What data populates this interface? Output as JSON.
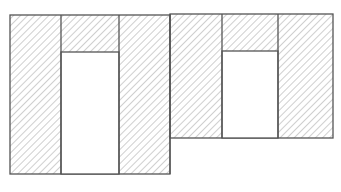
{
  "diagram": {
    "colors": {
      "stroke": "#555555",
      "hatch": "#9a9a9a",
      "fill": "#ffffff"
    },
    "blocks": [
      {
        "name": "left-block",
        "outer": {
          "x": 10,
          "y": 15,
          "w": 160,
          "h": 159
        },
        "dividers_x": [
          61,
          119
        ],
        "recess": {
          "x": 61,
          "y": 52,
          "w": 58,
          "h": 122
        }
      },
      {
        "name": "right-block",
        "outer": {
          "x": 170,
          "y": 14,
          "w": 163,
          "h": 124
        },
        "dividers_x": [
          222,
          278
        ],
        "recess": {
          "x": 222,
          "y": 51,
          "w": 56,
          "h": 87
        }
      }
    ]
  }
}
